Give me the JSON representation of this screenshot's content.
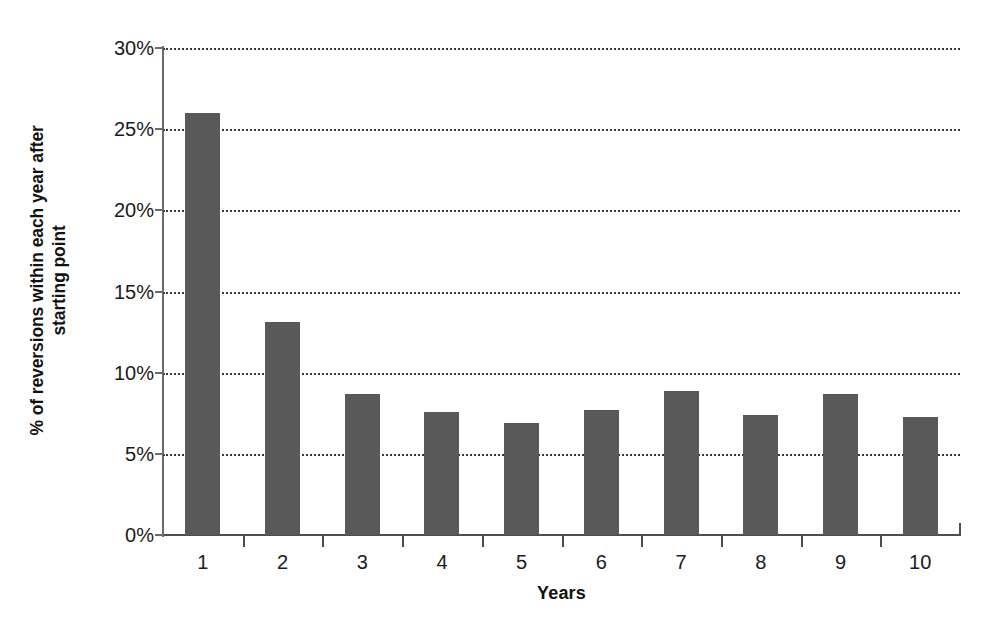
{
  "chart_data": {
    "type": "bar",
    "title": "",
    "subtitle": "",
    "xlabel": "Years",
    "ylabel": "% of reversions within each year after starting point",
    "ylabel_line1": "% of reversions within each year after",
    "ylabel_line2": "starting point",
    "categories": [
      "1",
      "2",
      "3",
      "4",
      "5",
      "6",
      "7",
      "8",
      "9",
      "10"
    ],
    "values": [
      26.0,
      13.1,
      8.7,
      7.6,
      6.9,
      7.7,
      8.9,
      7.4,
      8.7,
      7.3
    ],
    "value_unit": "%",
    "ylim": [
      0,
      30
    ],
    "ytick_values": [
      0,
      5,
      10,
      15,
      20,
      25,
      30
    ],
    "ytick_labels": [
      "0%",
      "5%",
      "10%",
      "15%",
      "20%",
      "25%",
      "30%"
    ],
    "grid": "horizontal-dotted",
    "legend": "none",
    "bar_color": "#595959",
    "gridline_color": "#3a3a3a",
    "axis_color": "#4d4d4d",
    "background_color": "#ffffff",
    "series": [
      {
        "name": "% of reversions",
        "values": [
          26.0,
          13.1,
          8.7,
          7.6,
          6.9,
          7.7,
          8.9,
          7.4,
          8.7,
          7.3
        ]
      }
    ]
  }
}
